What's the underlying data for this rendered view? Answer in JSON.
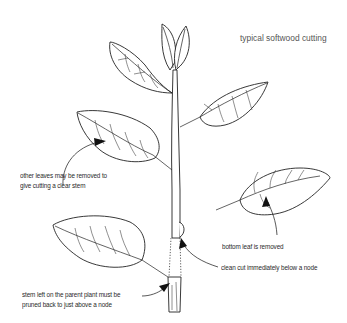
{
  "diagram": {
    "title": "typical softwood cutting",
    "labels": {
      "other_leaves": [
        "other leaves may be removed to",
        "give cutting a clear stem"
      ],
      "bottom_leaf": "bottom leaf is removed",
      "clean_cut": "clean cut immediately below a node",
      "stem_left": [
        "stem left on the parent plant must be",
        "pruned back to just above a node"
      ]
    },
    "icons": [
      "leaf-illustration",
      "stem-illustration",
      "arrow-pointer",
      "dotted-cut-line"
    ]
  }
}
